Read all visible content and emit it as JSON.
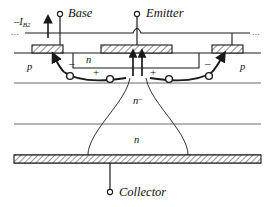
{
  "figure": {
    "type": "semiconductor-device-cross-section",
    "width": 275,
    "height": 207,
    "background": "#ffffff",
    "line_color": "#1a1a1a"
  },
  "terminals": {
    "base": {
      "label": "Base",
      "node_x": 60,
      "node_y": 15,
      "lead_from_y": 15,
      "lead_to_y": 47
    },
    "emitter": {
      "label": "Emitter",
      "node_x": 137,
      "node_y": 15,
      "lead_from_y": 15,
      "lead_to_y": 47
    },
    "collector": {
      "label": "Collector",
      "node_x": 110,
      "node_y": 193,
      "lead_from_y": 163,
      "lead_to_y": 193
    }
  },
  "current_label": {
    "text": "–I",
    "subscript": "B2",
    "direction": "up",
    "arrow_x": 60,
    "arrow_tip_y": 20
  },
  "metal_line": {
    "y": 33,
    "x_start": 25,
    "x_end": 250,
    "left_ellipsis": "...",
    "right_ellipsis": "..."
  },
  "contacts": [
    {
      "name": "base-contact-left",
      "x": 32,
      "width": 31,
      "y": 45,
      "height": 8,
      "hatch": true
    },
    {
      "name": "emitter-contact",
      "x": 101,
      "width": 71,
      "y": 45,
      "height": 8,
      "hatch": true
    },
    {
      "name": "base-contact-right",
      "x": 212,
      "width": 31,
      "y": 45,
      "height": 8,
      "hatch": true
    }
  ],
  "layers": [
    {
      "name": "p-base-left",
      "label": "p",
      "label_x": 28,
      "label_y": 66,
      "superscript": ""
    },
    {
      "name": "p-base-right",
      "label": "p",
      "label_x": 240,
      "label_y": 66,
      "superscript": ""
    },
    {
      "name": "n-emitter",
      "label": "n",
      "label_x": 87,
      "label_y": 59,
      "superscript": ""
    },
    {
      "name": "n-drift",
      "label": "n",
      "label_x": 136,
      "label_y": 100,
      "superscript": "–"
    },
    {
      "name": "n-buffer",
      "label": "n",
      "label_x": 136,
      "label_y": 139,
      "superscript": ""
    }
  ],
  "boundaries": {
    "surface_y": 53,
    "p_bottom_y": 83,
    "drift_bottom_y": 124,
    "substrate_top_y": 155,
    "substrate_bottom_y": 163
  },
  "collector_contact": {
    "name": "collector-contact",
    "x": 14,
    "width": 247,
    "y": 155,
    "height": 8,
    "hatch": true
  },
  "carriers": {
    "electrons": [
      {
        "cx": 70,
        "cy": 77,
        "sign": "–",
        "sign_x": 72,
        "sign_y": 64
      },
      {
        "cx": 110,
        "cy": 74,
        "sign": "",
        "sign_x": 0,
        "sign_y": 0
      },
      {
        "cx": 171,
        "cy": 74,
        "sign": "",
        "sign_x": 0,
        "sign_y": 0
      },
      {
        "cx": 212,
        "cy": 76,
        "sign": "–",
        "sign_x": 207,
        "sign_y": 64
      }
    ],
    "holes": [
      {
        "sign": "+",
        "x": 96,
        "y": 73
      },
      {
        "sign": "+",
        "x": 152,
        "y": 73
      }
    ]
  },
  "channel_arrows": [
    {
      "name": "emitter-injection-left",
      "x": 133,
      "tip_y": 57
    },
    {
      "name": "emitter-injection-right",
      "x": 142,
      "tip_y": 57
    }
  ]
}
